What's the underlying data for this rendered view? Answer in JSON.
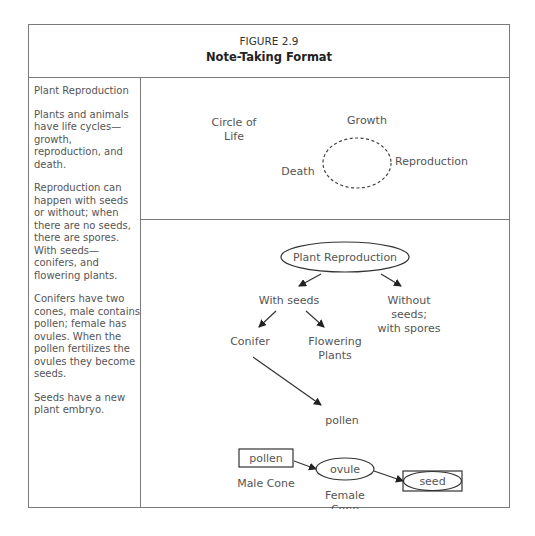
{
  "header": {
    "figure_number": "FIGURE 2.9",
    "title": "Note-Taking Format"
  },
  "notes": {
    "heading": "Plant Reproduction",
    "paragraphs": [
      "Plants and animals have life cycles—growth, reproduction, and death.",
      "Reproduction can happen with seeds or without; when there are no seeds, there are spores. With seeds—conifers, and flowering plants.",
      "Conifers have two cones, male contains pollen; female has ovules. When the pollen fertilizes the ovules they become seeds.",
      "Seeds have a new plant embryo."
    ]
  },
  "circle_diagram": {
    "title_line1": "Circle of",
    "title_line2": "Life",
    "growth": "Growth",
    "reproduction": "Reproduction",
    "death": "Death"
  },
  "concept_map": {
    "root": "Plant Reproduction",
    "with_seeds": "With seeds",
    "without_seeds_line1": "Without",
    "without_seeds_line2": "seeds;",
    "without_seeds_line3": "with spores",
    "conifer": "Conifer",
    "flowering_line1": "Flowering",
    "flowering_line2": "Plants",
    "pollen_label": "pollen",
    "pollen_box": "pollen",
    "male_cone": "Male Cone",
    "ovule": "ovule",
    "female_cone_line1": "Female",
    "female_cone_line2": "Cone",
    "seed": "seed"
  }
}
